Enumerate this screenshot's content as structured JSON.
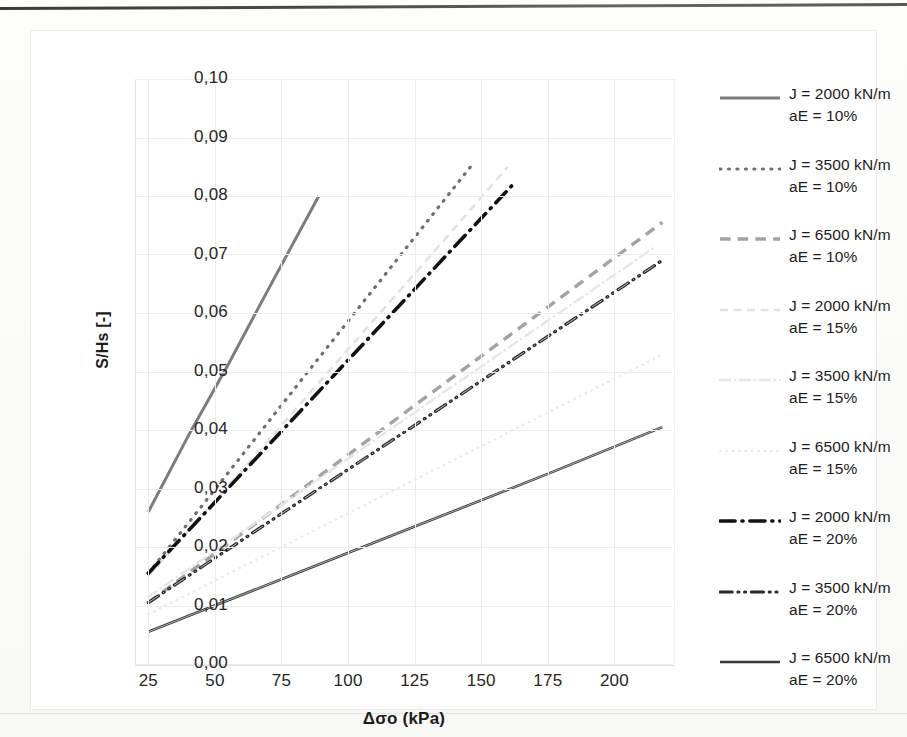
{
  "axes": {
    "x_title": "Δσo (kPa)",
    "y_title": "S/Hs [-]",
    "x_ticks": [
      "25",
      "50",
      "75",
      "100",
      "125",
      "150",
      "175",
      "200"
    ],
    "y_ticks": [
      "0,10",
      "0,09",
      "0,08",
      "0,07",
      "0,06",
      "0,05",
      "0,04",
      "0,03",
      "0,02",
      "0,01",
      "0,00"
    ]
  },
  "legend": {
    "items": [
      {
        "line1": "J = 2000 kN/m",
        "line2": "aE = 10%"
      },
      {
        "line1": "J = 3500 kN/m",
        "line2": "aE = 10%"
      },
      {
        "line1": "J = 6500 kN/m",
        "line2": "aE = 10%"
      },
      {
        "line1": "J = 2000 kN/m",
        "line2": "aE = 15%"
      },
      {
        "line1": "J = 3500 kN/m",
        "line2": "aE = 15%"
      },
      {
        "line1": "J = 6500 kN/m",
        "line2": "aE = 15%"
      },
      {
        "line1": "J = 2000 kN/m",
        "line2": "aE = 20%"
      },
      {
        "line1": "J = 3500 kN/m",
        "line2": "aE = 20%"
      },
      {
        "line1": "J = 6500 kN/m",
        "line2": "aE = 20%"
      }
    ]
  },
  "chart_data": {
    "type": "line",
    "title": "",
    "xlabel": "Δσo (kPa)",
    "ylabel": "S/Hs [-]",
    "xlim": [
      20,
      222
    ],
    "ylim": [
      0.0,
      0.1
    ],
    "xticks": [
      25,
      50,
      75,
      100,
      125,
      150,
      175,
      200
    ],
    "yticks": [
      0.0,
      0.01,
      0.02,
      0.03,
      0.04,
      0.05,
      0.06,
      0.07,
      0.08,
      0.09,
      0.1
    ],
    "grid": true,
    "legend_position": "right",
    "series": [
      {
        "name": "J = 2000 kN/m, aE = 10%",
        "J": 2000,
        "aE": "10%",
        "style": "solid",
        "color": "#7d7d7d",
        "width": 3.0,
        "x": [
          25,
          40,
          55,
          70,
          89
        ],
        "y": [
          0.026,
          0.039,
          0.0512,
          0.064,
          0.08
        ]
      },
      {
        "name": "J = 3500 kN/m, aE = 10%",
        "J": 3500,
        "aE": "10%",
        "style": "dotted",
        "color": "#6f6f6f",
        "width": 3.2,
        "x": [
          25,
          55,
          85,
          115,
          146
        ],
        "y": [
          0.0155,
          0.0327,
          0.05,
          0.0672,
          0.085
        ]
      },
      {
        "name": "J = 6500 kN/m, aE = 10%",
        "J": 6500,
        "aE": "10%",
        "style": "dashed",
        "color": "#a3a3a3",
        "width": 3.4,
        "x": [
          25,
          75,
          125,
          175,
          218
        ],
        "y": [
          0.0105,
          0.0273,
          0.0442,
          0.061,
          0.0755
        ]
      },
      {
        "name": "J = 2000 kN/m, aE = 15%",
        "J": 2000,
        "aE": "15%",
        "style": "dashed-faint",
        "color": "#e2e2e2",
        "width": 2.6,
        "x": [
          25,
          60,
          95,
          130,
          160
        ],
        "y": [
          0.015,
          0.033,
          0.0512,
          0.0693,
          0.085
        ]
      },
      {
        "name": "J = 3500 kN/m, aE = 15%",
        "J": 3500,
        "aE": "15%",
        "style": "dashdot-faint",
        "color": "#e6e6e6",
        "width": 2.4,
        "x": [
          25,
          75,
          125,
          175,
          215
        ],
        "y": [
          0.0115,
          0.0272,
          0.043,
          0.0587,
          0.0712
        ]
      },
      {
        "name": "J = 6500 kN/m, aE = 15%",
        "J": 6500,
        "aE": "15%",
        "style": "dotted-faint",
        "color": "#eaeaea",
        "width": 2.4,
        "x": [
          25,
          75,
          125,
          175,
          218
        ],
        "y": [
          0.0085,
          0.02,
          0.0315,
          0.043,
          0.0529
        ]
      },
      {
        "name": "J = 2000 kN/m, aE = 20%",
        "J": 2000,
        "aE": "20%",
        "style": "dashdot",
        "color": "#121212",
        "width": 3.6,
        "x": [
          25,
          60,
          95,
          130,
          162
        ],
        "y": [
          0.0155,
          0.0325,
          0.0495,
          0.0665,
          0.082
        ]
      },
      {
        "name": "J = 3500 kN/m, aE = 20%",
        "J": 3500,
        "aE": "20%",
        "style": "dashdotdot",
        "color": "#2a2a2a",
        "width": 3.2,
        "x": [
          25,
          75,
          125,
          175,
          218
        ],
        "y": [
          0.0105,
          0.0257,
          0.0408,
          0.056,
          0.069
        ]
      },
      {
        "name": "J = 6500 kN/m, aE = 20%",
        "J": 6500,
        "aE": "20%",
        "style": "solid-thin",
        "color": "#3a3a3a",
        "width": 2.6,
        "x": [
          25,
          75,
          125,
          175,
          218
        ],
        "y": [
          0.0055,
          0.0145,
          0.0235,
          0.0325,
          0.0405
        ]
      }
    ]
  }
}
